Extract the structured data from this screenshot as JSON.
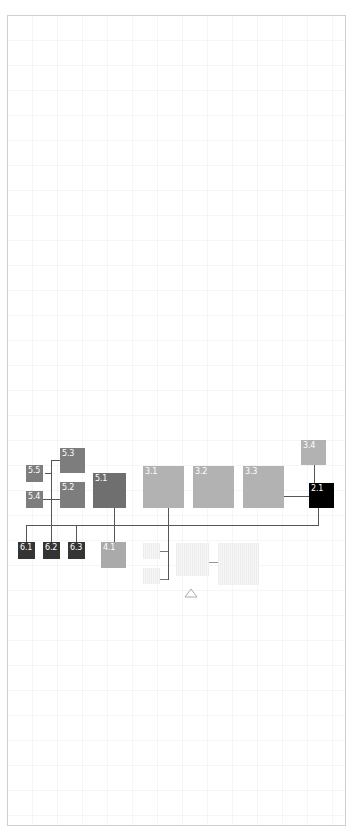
{
  "diagram": {
    "type": "hierarchy-boxes",
    "nodes": [
      {
        "id": "5.5",
        "label": "5.5",
        "shade": "mid-gray"
      },
      {
        "id": "5.4",
        "label": "5.4",
        "shade": "mid-gray"
      },
      {
        "id": "5.3",
        "label": "5.3",
        "shade": "mid-gray"
      },
      {
        "id": "5.2",
        "label": "5.2",
        "shade": "mid-gray"
      },
      {
        "id": "5.1",
        "label": "5.1",
        "shade": "dark-gray"
      },
      {
        "id": "3.1",
        "label": "3.1",
        "shade": "light-gray"
      },
      {
        "id": "3.2",
        "label": "3.2",
        "shade": "light-gray"
      },
      {
        "id": "3.3",
        "label": "3.3",
        "shade": "light-gray"
      },
      {
        "id": "3.4",
        "label": "3.4",
        "shade": "light-gray"
      },
      {
        "id": "2.1",
        "label": "2.1",
        "shade": "black"
      },
      {
        "id": "6.1",
        "label": "6.1",
        "shade": "charcoal"
      },
      {
        "id": "6.2",
        "label": "6.2",
        "shade": "charcoal"
      },
      {
        "id": "6.3",
        "label": "6.3",
        "shade": "charcoal"
      },
      {
        "id": "4.1",
        "label": "4.1",
        "shade": "light-gray"
      }
    ],
    "faint_nodes": 4,
    "marker": "triangle-up-outline",
    "colors": {
      "black": "#000000",
      "charcoal": "#343434",
      "dark_gray": "#6f6f6f",
      "mid_gray": "#7d7d7d",
      "light_gray": "#b2b2b2",
      "line": "#555555",
      "frame": "#cfcfcf"
    }
  }
}
